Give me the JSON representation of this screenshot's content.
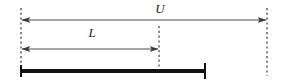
{
  "figure": {
    "kind": "interval-dimension-diagram",
    "background_color": "#ffffff",
    "width": 284,
    "height": 83
  },
  "labels": {
    "upper_bound": "U",
    "lower_bound": "L"
  },
  "colors": {
    "guide_line": "#4d4d4d",
    "arrow_line": "#4d4d4d",
    "bar": "#111111",
    "bar_endcap": "#111111",
    "text": "#1a1a1a"
  },
  "guides": [
    {
      "name": "left-guide",
      "x": 21,
      "y1": 8,
      "y2": 76
    },
    {
      "name": "middle-guide",
      "x": 159,
      "y1": 26,
      "y2": 74
    },
    {
      "name": "right-guide",
      "x": 267,
      "y1": 8,
      "y2": 76
    }
  ],
  "dimensions": [
    {
      "name": "U",
      "label": "U",
      "y": 20,
      "x_start": 21,
      "x_end": 267,
      "label_x": 160,
      "label_y": 13,
      "arrow_start": true,
      "arrow_end": true
    },
    {
      "name": "L",
      "label": "L",
      "y": 49,
      "x_start": 21,
      "x_end": 159,
      "label_x": 92,
      "label_y": 37,
      "arrow_start": true,
      "arrow_end": true
    }
  ],
  "bar": {
    "name": "measured-bar",
    "x_start": 21,
    "x_end": 205,
    "y": 71,
    "thickness": 4,
    "endcap": {
      "x": 205,
      "y1": 63,
      "y2": 79,
      "width": 2
    },
    "startcap": {
      "x": 21,
      "y1": 65,
      "y2": 77,
      "width": 2
    }
  }
}
